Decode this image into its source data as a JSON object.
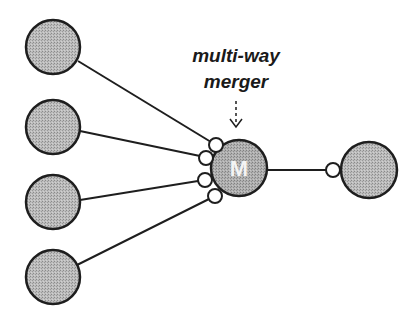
{
  "diagram": {
    "label": {
      "line1": "multi-way",
      "line2": "merger"
    },
    "merger_node": {
      "text": "M"
    },
    "colors": {
      "node_fill": "#b4b4b4",
      "merger_fill": "#a8a8a8",
      "stroke": "#1e1e1e",
      "port_fill": "#ffffff",
      "background": "#ffffff"
    },
    "input_nodes": [
      {
        "id": "input-1"
      },
      {
        "id": "input-2"
      },
      {
        "id": "input-3"
      },
      {
        "id": "input-4"
      }
    ],
    "output_node": {
      "id": "output"
    },
    "ports": {
      "input_ports": 4,
      "output_ports": 1
    }
  }
}
